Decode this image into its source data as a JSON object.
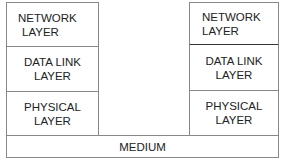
{
  "diagram": {
    "left_stack": {
      "layers": [
        {
          "line1": "NETWORK",
          "line2": "LAYER"
        },
        {
          "line1": "DATA LINK",
          "line2": "LAYER"
        },
        {
          "line1": "PHYSICAL",
          "line2": "LAYER"
        }
      ]
    },
    "right_stack": {
      "layers": [
        {
          "line1": "NETWORK",
          "line2": "LAYER"
        },
        {
          "line1": "DATA LINK",
          "line2": "LAYER"
        },
        {
          "line1": "PHYSICAL",
          "line2": "LAYER"
        }
      ]
    },
    "medium": {
      "label": "MEDIUM"
    },
    "colors": {
      "border": "#888888",
      "text": "#222222",
      "background": "#ffffff"
    }
  }
}
